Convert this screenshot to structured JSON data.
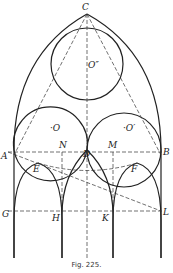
{
  "figure": {
    "caption": "Fig. 225.",
    "labels": {
      "C": "C",
      "O2": "O″",
      "O": "·O",
      "O1": "·O′",
      "A": "A",
      "N": "N",
      "D": "D",
      "M": "M",
      "B": "B",
      "E": "E",
      "F": "F",
      "G": "G",
      "H": "H",
      "K": "K",
      "L": "L"
    }
  }
}
